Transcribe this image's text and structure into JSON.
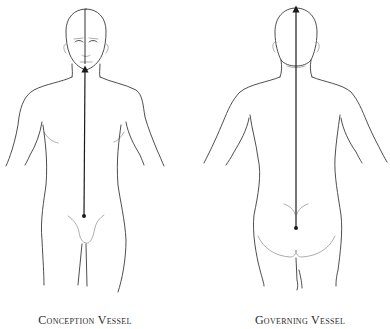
{
  "figures": [
    {
      "id": "front",
      "label": "Conception Vessel",
      "view": "anterior",
      "meridian": {
        "start": "perineum-point",
        "end": "lower-lip",
        "direction": "upward"
      }
    },
    {
      "id": "back",
      "label": "Governing Vessel",
      "view": "posterior",
      "meridian": {
        "start": "coccyx-point",
        "end": "top-of-head",
        "direction": "upward"
      }
    }
  ],
  "colors": {
    "line": "#3a3a3a",
    "meridian": "#1a1a1a",
    "background": "#ffffff"
  }
}
